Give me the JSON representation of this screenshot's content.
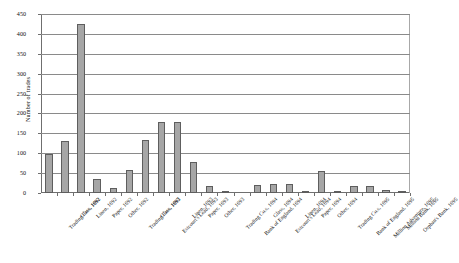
{
  "chart_data": {
    "type": "bar",
    "title": "",
    "xlabel": "",
    "ylabel": "Number of trades",
    "ylim": [
      0,
      450
    ],
    "ytick_step": 50,
    "yticks": [
      "0",
      "50",
      "100",
      "150",
      "200",
      "250",
      "300",
      "350",
      "400",
      "450"
    ],
    "grid": true,
    "legend": false,
    "bar_color": "#a6a6a6",
    "bar_edge_color": "#5e5e5e",
    "categories": [
      "Trading Co.s, 1692",
      "Glass, 1692",
      "Linen, 1692",
      "Paper, 1692",
      "Other, 1692",
      "Trading Co.s, 1693",
      "Glass, 1693",
      "Estcourt's Lead, 1693",
      "Linen, 1693",
      "Paper, 1693",
      "Other, 1693",
      "Trading Co.s, 1694",
      "Bank of England, 1694",
      "Glass, 1694",
      "Estcourt's Lead, 1694",
      "Linen, 1694",
      "Paper, 1694",
      "Other, 1694",
      "Trading Co.s, 1695",
      "Bank of England, 1695",
      "Million Adventure, 1695",
      "Million Bank, 1695",
      "Orphan's Bank, 1695"
    ],
    "values": [
      97,
      132,
      425,
      35,
      12,
      58,
      134,
      178,
      178,
      78,
      18,
      5,
      0,
      20,
      22,
      22,
      4,
      55,
      2,
      18,
      17,
      8,
      5
    ]
  }
}
